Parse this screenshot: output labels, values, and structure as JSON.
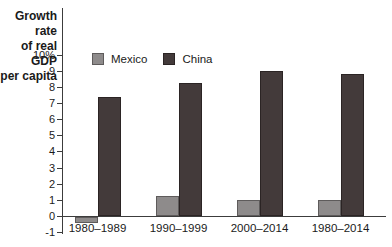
{
  "figure": {
    "y_axis_title_lines": [
      "Growth rate",
      "of real GDP",
      "per capita"
    ]
  },
  "chart_data": {
    "type": "bar",
    "title": "Growth rate of real GDP per capita",
    "ylabel": "Growth rate of real GDP per capita (%)",
    "xlabel": "",
    "categories": [
      "1980–1989",
      "1990–1999",
      "2000–2014",
      "1980–2014"
    ],
    "series": [
      {
        "name": "Mexico",
        "color": "#8e8b8b",
        "border": "#5e5b5b",
        "values": [
          -0.4,
          1.3,
          1.0,
          1.0
        ]
      },
      {
        "name": "China",
        "color": "#433a3a",
        "border": "#2b2424",
        "values": [
          7.4,
          8.3,
          9.0,
          8.8
        ]
      }
    ],
    "ylim": [
      -1,
      10
    ],
    "yticks": [
      10,
      9,
      8,
      7,
      6,
      5,
      4,
      3,
      2,
      1,
      0,
      -1
    ],
    "ytick_labels": [
      "10%",
      "9",
      "8",
      "7",
      "6",
      "5",
      "4",
      "3",
      "2",
      "1",
      "0",
      "-1"
    ],
    "grid": false,
    "legend_position": "top-inside"
  }
}
